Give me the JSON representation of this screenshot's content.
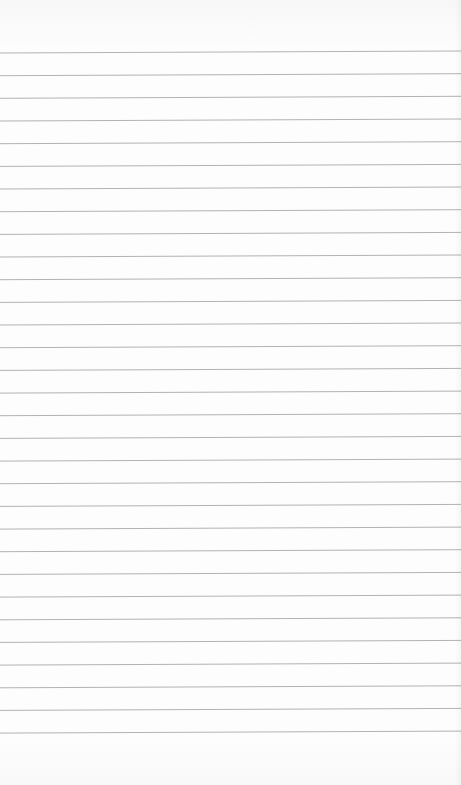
{
  "paper": {
    "type": "lined-paper",
    "line_count": 31,
    "first_line_y": 52,
    "line_spacing": 22.67,
    "line_color": "#a9a9a9",
    "background_color": "#fdfdfd",
    "tilt_px": 2
  }
}
